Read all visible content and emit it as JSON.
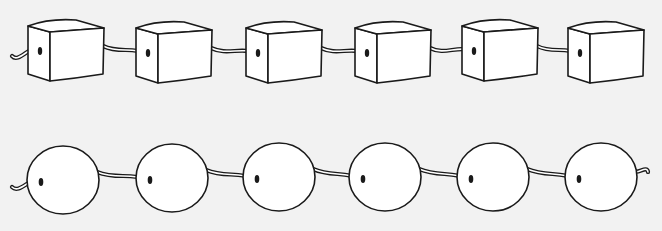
{
  "figure": {
    "background": "#f2f2f2",
    "stroke": "#1a1a1a",
    "fill": "#ffffff"
  },
  "rows": [
    {
      "name": "cube-string",
      "shape": "cube",
      "count": 6,
      "positions": [
        {
          "x": 28,
          "y": 20
        },
        {
          "x": 136,
          "y": 22
        },
        {
          "x": 246,
          "y": 22
        },
        {
          "x": 355,
          "y": 22
        },
        {
          "x": 462,
          "y": 20
        },
        {
          "x": 568,
          "y": 22
        }
      ],
      "size": {
        "w": 76,
        "h": 60,
        "depth": 22
      }
    },
    {
      "name": "sphere-string",
      "shape": "sphere",
      "count": 6,
      "positions": [
        {
          "cx": 63,
          "cy": 180
        },
        {
          "cx": 172,
          "cy": 178
        },
        {
          "cx": 279,
          "cy": 177
        },
        {
          "cx": 385,
          "cy": 177
        },
        {
          "cx": 493,
          "cy": 177
        },
        {
          "cx": 601,
          "cy": 177
        }
      ],
      "radius": 35
    }
  ]
}
